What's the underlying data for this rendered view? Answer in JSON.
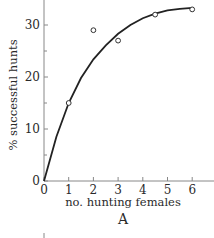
{
  "chart_data": {
    "type": "scatter",
    "title": "",
    "panel_label": "A",
    "xlabel": "no. hunting females",
    "ylabel": "% successful hunts",
    "xlim": [
      0,
      6.5
    ],
    "ylim": [
      0,
      35
    ],
    "x_ticks": [
      "0",
      "1",
      "2",
      "3",
      "4",
      "5",
      "6"
    ],
    "y_ticks": [
      "0",
      "10",
      "20",
      "30"
    ],
    "grid": false,
    "legend": null,
    "series": [
      {
        "name": "observed",
        "marker": "open-circle",
        "x": [
          1,
          2,
          3,
          4.5,
          6
        ],
        "y": [
          15,
          29,
          27,
          32,
          33
        ]
      },
      {
        "name": "fitted curve",
        "type": "line",
        "x": [
          0,
          0.5,
          1,
          1.5,
          2,
          2.5,
          3,
          3.5,
          4,
          4.5,
          5,
          5.5,
          6
        ],
        "y": [
          0,
          8.5,
          15,
          19.8,
          23.4,
          26.1,
          28.3,
          30.0,
          31.3,
          32.2,
          32.8,
          33.1,
          33.3
        ]
      }
    ]
  }
}
